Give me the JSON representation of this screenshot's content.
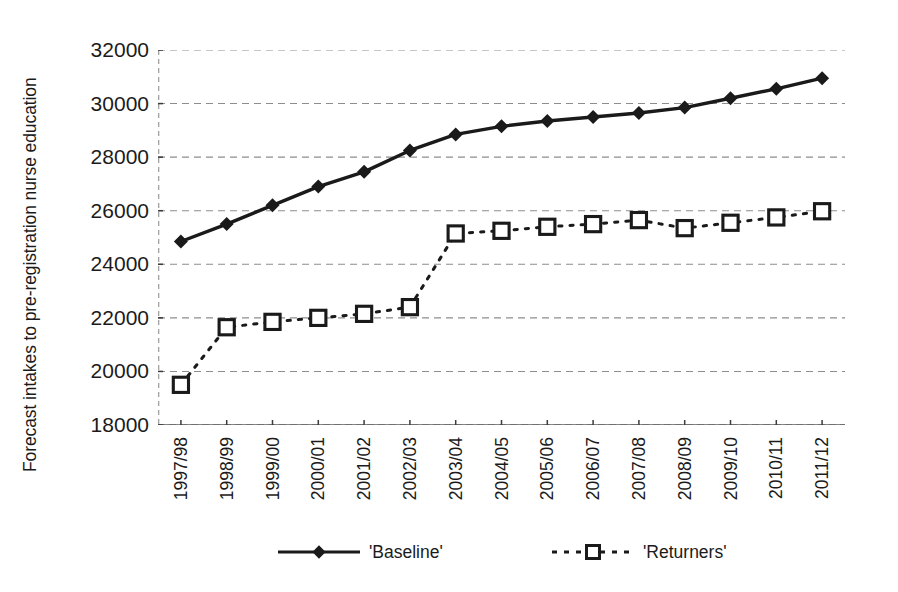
{
  "chart_data": {
    "type": "line",
    "title": "",
    "xlabel": "",
    "ylabel": "Forecast intakes to pre-registration nurse education",
    "ylim": [
      18000,
      32000
    ],
    "ytick_step": 2000,
    "yticks": [
      18000,
      20000,
      22000,
      24000,
      26000,
      28000,
      30000,
      32000
    ],
    "ytick_labels": [
      "18000",
      "20000",
      "22000",
      "24000",
      "26000",
      "28000",
      "30000",
      "32000"
    ],
    "grid": true,
    "grid_style": "dashed-horizontal",
    "legend_position": "bottom",
    "categories": [
      "1997/98",
      "1998/99",
      "1999/00",
      "2000/01",
      "2001/02",
      "2002/03",
      "2003/04",
      "2004/05",
      "2005/06",
      "2006/07",
      "2007/08",
      "2008/09",
      "2009/10",
      "2010/11",
      "2011/12"
    ],
    "series": [
      {
        "name": "'Baseline'",
        "marker": "diamond",
        "line": "solid",
        "color": "#1a1a1a",
        "values": [
          24850,
          25500,
          26200,
          26900,
          27450,
          28250,
          28850,
          29150,
          29350,
          29500,
          29650,
          29850,
          30200,
          30550,
          30950
        ]
      },
      {
        "name": "'Returners'",
        "marker": "open-square",
        "line": "dashed",
        "color": "#1a1a1a",
        "values": [
          19500,
          21650,
          21850,
          22000,
          22150,
          22400,
          25150,
          25250,
          25400,
          25500,
          25650,
          25350,
          25550,
          25750,
          25980
        ]
      }
    ]
  },
  "axes": {
    "y_title": "Forecast intakes to pre-registration nurse education"
  },
  "legend": {
    "entries": [
      {
        "label": "'Baseline'"
      },
      {
        "label": "'Returners'"
      }
    ]
  }
}
